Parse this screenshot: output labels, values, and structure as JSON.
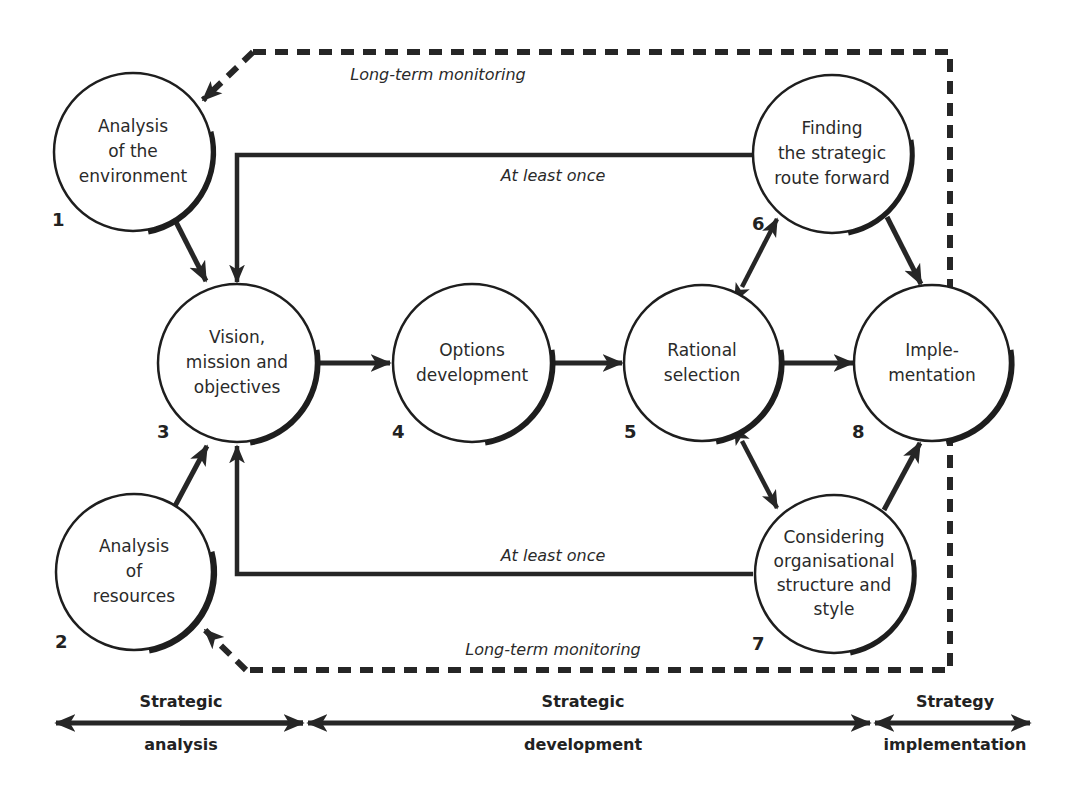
{
  "nodes": [
    {
      "id": 1,
      "number": "1",
      "lines": [
        "Analysis",
        "of the",
        "environment"
      ]
    },
    {
      "id": 2,
      "number": "2",
      "lines": [
        "Analysis",
        "of",
        "resources"
      ]
    },
    {
      "id": 3,
      "number": "3",
      "lines": [
        "Vision,",
        "mission and",
        "objectives"
      ]
    },
    {
      "id": 4,
      "number": "4",
      "lines": [
        "Options",
        "development"
      ]
    },
    {
      "id": 5,
      "number": "5",
      "lines": [
        "Rational",
        "selection"
      ]
    },
    {
      "id": 6,
      "number": "6",
      "lines": [
        "Finding",
        "the strategic",
        "route forward"
      ]
    },
    {
      "id": 7,
      "number": "7",
      "lines": [
        "Considering",
        "organisational",
        "structure and",
        "style"
      ]
    },
    {
      "id": 8,
      "number": "8",
      "lines": [
        "Imple-",
        "mentation"
      ]
    }
  ],
  "edge_labels": {
    "monitoring_top": "Long-term monitoring",
    "monitoring_bottom": "Long-term monitoring",
    "feedback_top": "At least once",
    "feedback_bottom": "At least once"
  },
  "phases": [
    {
      "top": "Strategic",
      "bottom": "analysis"
    },
    {
      "top": "Strategic",
      "bottom": "development"
    },
    {
      "top": "Strategy",
      "bottom": "implementation"
    }
  ],
  "colors": {
    "line": "#262626",
    "background": "#ffffff"
  }
}
